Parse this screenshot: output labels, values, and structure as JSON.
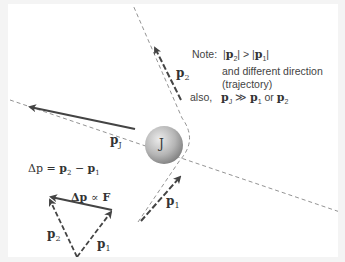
{
  "colors": {
    "background": "#ffffff",
    "frame": "#f4f4f4",
    "arrow": "#444444",
    "dashed_line": "#666666",
    "sphere_light": "#e6e6e6",
    "sphere_dark": "#8a8a8a",
    "text": "#333333"
  },
  "planet": {
    "label": "J"
  },
  "vectors": {
    "p2": {
      "base": "p",
      "sub": "2"
    },
    "pj": {
      "base": "p",
      "sub": "J"
    },
    "p1": {
      "base": "p",
      "sub": "1"
    },
    "tri_p2": {
      "base": "p",
      "sub": "2"
    },
    "tri_p1": {
      "base": "p",
      "sub": "1"
    }
  },
  "note": {
    "line1_prefix": "Note:",
    "line1_expr_a": "p",
    "line1_expr_a_sub": "2",
    "line1_op": ">",
    "line1_expr_b": "p",
    "line1_expr_b_sub": "1",
    "line2": "and different direction",
    "line3": "(trajectory)",
    "line4_prefix": "also,",
    "line4_a": "p",
    "line4_a_sub": "J",
    "line4_op": "≫",
    "line4_b": "p",
    "line4_b_sub": "1",
    "line4_or": "or",
    "line4_c": "p",
    "line4_c_sub": "2"
  },
  "equations": {
    "delta_p": {
      "lhs": "Δp",
      "eq": "=",
      "a": "p",
      "a_sub": "2",
      "minus": "−",
      "b": "p",
      "b_sub": "1"
    },
    "proportional": {
      "lhs": "Δp",
      "op": "∝",
      "rhs": "F"
    }
  }
}
